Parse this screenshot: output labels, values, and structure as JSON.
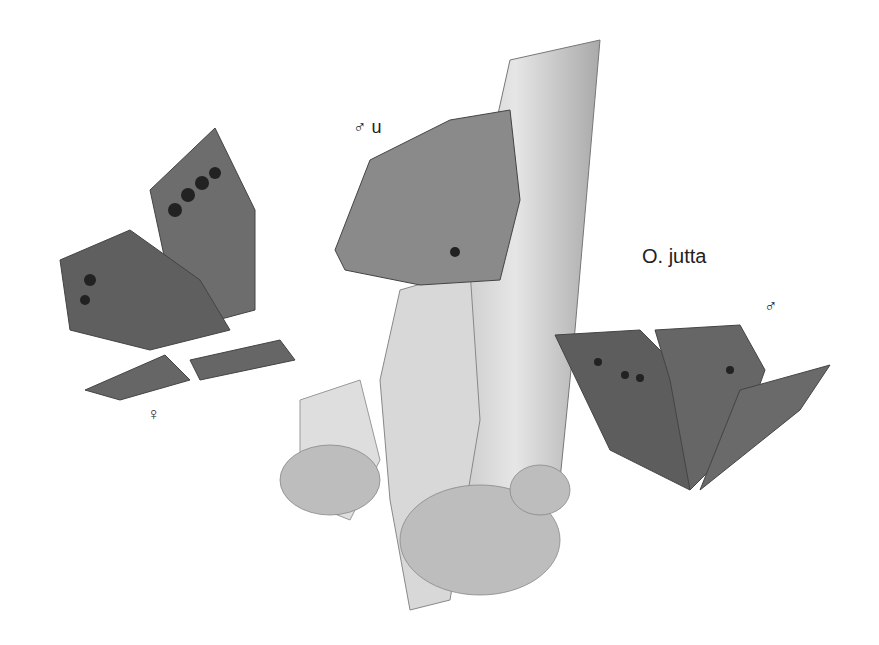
{
  "labels": {
    "male_underside": "♂ u",
    "species": "O. jutta",
    "male": "♂",
    "female": "♀"
  },
  "palette": {
    "background": "#ffffff",
    "wing_dark": "#555555",
    "wing_mid": "#7a7a7a",
    "bark": "#cfcfcf",
    "lichen": "#b8b8b8"
  }
}
